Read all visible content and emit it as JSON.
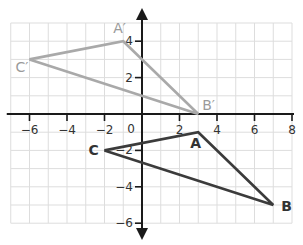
{
  "diagram": {
    "type": "coordinate-plane-transformation",
    "x_range": [
      -7,
      8
    ],
    "y_range": [
      -6,
      5
    ],
    "x_tick_labels": [
      "-6",
      "-4",
      "-2",
      "2",
      "4",
      "6",
      "8"
    ],
    "x_ticks": [
      -6,
      -4,
      -2,
      2,
      4,
      6,
      8
    ],
    "y_tick_labels": [
      "4",
      "2",
      "-2",
      "-4",
      "-6"
    ],
    "y_ticks": [
      4,
      2,
      -2,
      -4,
      -6
    ],
    "origin_label": "0",
    "colors": {
      "grid": "#dddddd",
      "axis": "#1a1a1a",
      "original": "#3b3b3b",
      "image": "#a9a9a9",
      "original_label": "#333333",
      "image_label": "#9a9a9a"
    },
    "original_triangle": {
      "name": "ABC",
      "vertices": [
        {
          "label": "A",
          "x": 3,
          "y": -1
        },
        {
          "label": "B",
          "x": 7,
          "y": -5
        },
        {
          "label": "C",
          "x": -2,
          "y": -2
        }
      ]
    },
    "image_triangle": {
      "name": "A'B'C'",
      "vertices": [
        {
          "label": "A′",
          "x": -1,
          "y": 4
        },
        {
          "label": "B′",
          "x": 3,
          "y": 0
        },
        {
          "label": "C′",
          "x": -6,
          "y": 3
        }
      ]
    }
  }
}
